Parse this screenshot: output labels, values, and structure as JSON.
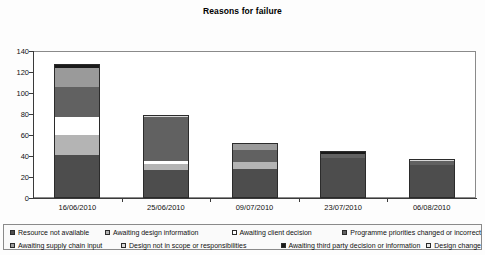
{
  "chart_data": {
    "type": "bar",
    "subtype": "stacked-bar",
    "title": "Reasons for failure",
    "xlabel": "",
    "ylabel": "",
    "ylim": [
      0,
      140
    ],
    "yticks": [
      0,
      20,
      40,
      60,
      80,
      100,
      120,
      140
    ],
    "grid": false,
    "legend_position": "bottom",
    "categories": [
      "16/06/2010",
      "25/06/2010",
      "09/07/2010",
      "23/07/2010",
      "06/08/2010"
    ],
    "series": [
      {
        "name": "Resource not available",
        "color": "#4d4d4d",
        "values": [
          41,
          27,
          28,
          38,
          31
        ]
      },
      {
        "name": "Awaiting design information",
        "color": "#b4b4b4",
        "values": [
          19,
          5,
          6,
          0,
          0
        ]
      },
      {
        "name": "Awaiting client decision",
        "color": "#ffffff",
        "values": [
          17,
          3,
          0,
          0,
          0
        ]
      },
      {
        "name": "Programme priorities changed or incorrect",
        "color": "#616161",
        "values": [
          29,
          42,
          12,
          4,
          4
        ]
      },
      {
        "name": "Awaiting supply chain input",
        "color": "#9a9a9a",
        "values": [
          18,
          0,
          6,
          0,
          0
        ]
      },
      {
        "name": "Design not in scope or responsibilities",
        "color": "#d8d8d8",
        "values": [
          0,
          2,
          0,
          0,
          2
        ]
      },
      {
        "name": "Awaiting third party decision or information",
        "color": "#1a1a1a",
        "values": [
          3,
          0,
          0,
          3,
          0
        ]
      },
      {
        "name": "Design change",
        "color": "#e8e8e8",
        "values": [
          1,
          0,
          0,
          0,
          0
        ]
      }
    ],
    "totals": [
      128,
      79,
      52,
      45,
      37
    ]
  },
  "legend": {
    "row1": [
      {
        "label": "Resource not available",
        "color": "#4d4d4d"
      },
      {
        "label": "Awaiting design information",
        "color": "#b4b4b4"
      },
      {
        "label": "Awaiting client decision",
        "color": "#ffffff"
      },
      {
        "label": "Programme priorities changed or incorrect",
        "color": "#616161"
      }
    ],
    "row2": [
      {
        "label": "Awaiting supply chain input",
        "color": "#9a9a9a"
      },
      {
        "label": "Design not in scope or responsibilities",
        "color": "#d8d8d8"
      },
      {
        "label": "Awaiting third party decision or information",
        "color": "#1a1a1a"
      },
      {
        "label": "Design change",
        "color": "#e8e8e8"
      }
    ]
  }
}
